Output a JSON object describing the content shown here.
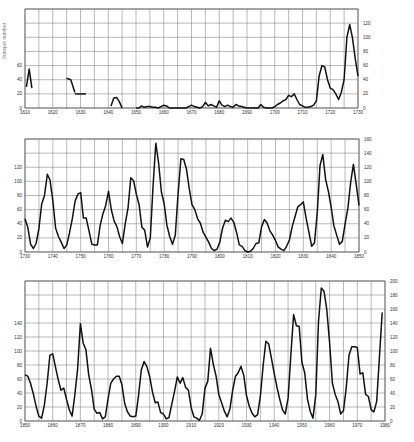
{
  "chart_data": [
    {
      "type": "line",
      "title": "",
      "ylabel": "Sunspot number",
      "xlabel": "",
      "xlim": [
        1610,
        1730
      ],
      "ylim": [
        0,
        140
      ],
      "grid": true,
      "x_ticks": [
        "1610",
        "1620",
        "1630",
        "1640",
        "1650",
        "1660",
        "1670",
        "1680",
        "1690",
        "1700",
        "1710",
        "1720",
        "1730"
      ],
      "y_ticks_left": [
        "0",
        "20",
        "40",
        "60"
      ],
      "y_ticks_right": [
        "0",
        "20",
        "40",
        "60",
        "80",
        "100",
        "120"
      ],
      "frame": {
        "left": 25,
        "top": 9,
        "right": 358,
        "bottom": 108
      },
      "segments": [
        {
          "x": [
            1610.5,
            1611.5,
            1612.5
          ],
          "y": [
            30,
            55,
            28
          ]
        },
        {
          "x": [
            1625,
            1626.5,
            1628
          ],
          "y": [
            42,
            40,
            22
          ]
        },
        {
          "x": [
            1628,
            1632
          ],
          "y": [
            20,
            20
          ]
        },
        {
          "x": [
            1641,
            1642,
            1643,
            1644,
            1645
          ],
          "y": [
            3,
            14,
            15,
            9,
            0
          ]
        },
        {
          "x": [
            1650,
            1651,
            1652,
            1653,
            1654,
            1655,
            1656,
            1657,
            1658,
            1659,
            1660,
            1661,
            1662,
            1663,
            1664,
            1665,
            1666,
            1667,
            1668,
            1669,
            1670,
            1671,
            1672,
            1673,
            1674,
            1675,
            1676,
            1677,
            1678,
            1679,
            1680,
            1681,
            1682,
            1683,
            1684,
            1685,
            1686,
            1687,
            1688,
            1689,
            1690,
            1691,
            1692,
            1693,
            1694,
            1695,
            1696,
            1697,
            1698,
            1699,
            1700,
            1701,
            1702,
            1703,
            1704,
            1705,
            1706,
            1707,
            1708,
            1709,
            1710,
            1711,
            1712,
            1713,
            1714,
            1715,
            1716,
            1717,
            1718,
            1719,
            1720,
            1721,
            1722,
            1723,
            1724,
            1725,
            1726,
            1727,
            1728,
            1729,
            1730
          ],
          "y": [
            0,
            0,
            3,
            1,
            2,
            2,
            1,
            1,
            0,
            2,
            4,
            3,
            0,
            0,
            0,
            0,
            0,
            0,
            0,
            2,
            4,
            2,
            1,
            0,
            2,
            8,
            3,
            5,
            3,
            1,
            10,
            4,
            2,
            4,
            2,
            1,
            5,
            3,
            2,
            1,
            0,
            0,
            0,
            0,
            0,
            5,
            1,
            0,
            0,
            0,
            2,
            5,
            7,
            10,
            12,
            18,
            16,
            20,
            12,
            5,
            3,
            1,
            1,
            2,
            4,
            10,
            45,
            60,
            58,
            40,
            28,
            26,
            20,
            12,
            22,
            40,
            100,
            118,
            100,
            70,
            45
          ]
        }
      ]
    },
    {
      "type": "line",
      "title": "",
      "xlim": [
        1730,
        1850
      ],
      "ylim": [
        0,
        160
      ],
      "grid": true,
      "x_ticks": [
        "1730",
        "1740",
        "1750",
        "1760",
        "1770",
        "1780",
        "1790",
        "1800",
        "1810",
        "1820",
        "1830",
        "1840",
        "1850"
      ],
      "y_ticks_left": [
        "0",
        "20",
        "40",
        "60",
        "80",
        "100",
        "120"
      ],
      "y_ticks_right": [
        "0",
        "20",
        "40",
        "60",
        "80",
        "100",
        "120",
        "140",
        "160"
      ],
      "frame": {
        "left": 25,
        "top": 139,
        "right": 359,
        "bottom": 252
      },
      "segments": [
        {
          "x": [
            1730,
            1731,
            1732,
            1733,
            1734,
            1735,
            1736,
            1737,
            1738,
            1739,
            1740,
            1741,
            1742,
            1743,
            1744,
            1745,
            1746,
            1747,
            1748,
            1749,
            1750,
            1751,
            1752,
            1753,
            1754,
            1755,
            1756,
            1757,
            1758,
            1759,
            1760,
            1761,
            1762,
            1763,
            1764,
            1765,
            1766,
            1767,
            1768,
            1769,
            1770,
            1771,
            1772,
            1773,
            1774,
            1775,
            1776,
            1777,
            1778,
            1779,
            1780,
            1781,
            1782,
            1783,
            1784,
            1785,
            1786,
            1787,
            1788,
            1789,
            1790,
            1791,
            1792,
            1793,
            1794,
            1795,
            1796,
            1797,
            1798,
            1799,
            1800,
            1801,
            1802,
            1803,
            1804,
            1805,
            1806,
            1807,
            1808,
            1809,
            1810,
            1811,
            1812,
            1813,
            1814,
            1815,
            1816,
            1817,
            1818,
            1819,
            1820,
            1821,
            1822,
            1823,
            1824,
            1825,
            1826,
            1827,
            1828,
            1829,
            1830,
            1831,
            1832,
            1833,
            1834,
            1835,
            1836,
            1837,
            1838,
            1839,
            1840,
            1841,
            1842,
            1843,
            1844,
            1845,
            1846,
            1847,
            1848,
            1849,
            1850
          ],
          "y": [
            47,
            35,
            11,
            5,
            12,
            33,
            68,
            80,
            110,
            102,
            73,
            34,
            22,
            14,
            5,
            10,
            27,
            47,
            72,
            82,
            84,
            48,
            48,
            30,
            11,
            10,
            10,
            38,
            54,
            66,
            86,
            60,
            44,
            36,
            22,
            12,
            40,
            62,
            105,
            101,
            82,
            67,
            35,
            31,
            7,
            20,
            92,
            154,
            126,
            85,
            68,
            38,
            22,
            11,
            24,
            83,
            132,
            131,
            118,
            90,
            67,
            60,
            47,
            41,
            28,
            21,
            14,
            5,
            2,
            4,
            14,
            34,
            45,
            43,
            48,
            42,
            28,
            10,
            8,
            2,
            0,
            1,
            5,
            12,
            13,
            36,
            46,
            41,
            30,
            24,
            16,
            7,
            4,
            2,
            8,
            17,
            36,
            50,
            64,
            67,
            71,
            48,
            28,
            8,
            13,
            57,
            122,
            138,
            103,
            86,
            63,
            37,
            24,
            11,
            15,
            40,
            62,
            98,
            124,
            96,
            66
          ]
        }
      ]
    },
    {
      "type": "line",
      "title": "",
      "xlim": [
        1850,
        1980
      ],
      "ylim": [
        0,
        200
      ],
      "grid": true,
      "x_ticks": [
        "1850",
        "1860",
        "1870",
        "1880",
        "1890",
        "1900",
        "1910",
        "1920",
        "1930",
        "1940",
        "1950",
        "1960",
        "1970",
        "1980"
      ],
      "y_ticks_left": [
        "0",
        "20",
        "40",
        "60",
        "80",
        "100",
        "120",
        "140"
      ],
      "y_ticks_right": [
        "0",
        "20",
        "40",
        "60",
        "80",
        "100",
        "120",
        "140",
        "160",
        "180",
        "200"
      ],
      "frame": {
        "left": 25,
        "top": 281,
        "right": 385,
        "bottom": 421
      },
      "segments": [
        {
          "x": [
            1850,
            1851,
            1852,
            1853,
            1854,
            1855,
            1856,
            1857,
            1858,
            1859,
            1860,
            1861,
            1862,
            1863,
            1864,
            1865,
            1866,
            1867,
            1868,
            1869,
            1870,
            1871,
            1872,
            1873,
            1874,
            1875,
            1876,
            1877,
            1878,
            1879,
            1880,
            1881,
            1882,
            1883,
            1884,
            1885,
            1886,
            1887,
            1888,
            1889,
            1890,
            1891,
            1892,
            1893,
            1894,
            1895,
            1896,
            1897,
            1898,
            1899,
            1900,
            1901,
            1902,
            1903,
            1904,
            1905,
            1906,
            1907,
            1908,
            1909,
            1910,
            1911,
            1912,
            1913,
            1914,
            1915,
            1916,
            1917,
            1918,
            1919,
            1920,
            1921,
            1922,
            1923,
            1924,
            1925,
            1926,
            1927,
            1928,
            1929,
            1930,
            1931,
            1932,
            1933,
            1934,
            1935,
            1936,
            1937,
            1938,
            1939,
            1940,
            1941,
            1942,
            1943,
            1944,
            1945,
            1946,
            1947,
            1948,
            1949,
            1950,
            1951,
            1952,
            1953,
            1954,
            1955,
            1956,
            1957,
            1958,
            1959,
            1960,
            1961,
            1962,
            1963,
            1964,
            1965,
            1966,
            1967,
            1968,
            1969,
            1970,
            1971,
            1972,
            1973,
            1974,
            1975,
            1976,
            1977,
            1978,
            1979
          ],
          "y": [
            66,
            64,
            54,
            39,
            21,
            7,
            4,
            23,
            55,
            94,
            96,
            77,
            59,
            44,
            47,
            31,
            16,
            7,
            37,
            74,
            139,
            111,
            102,
            66,
            45,
            17,
            11,
            12,
            3,
            6,
            32,
            54,
            60,
            64,
            64,
            52,
            25,
            13,
            7,
            6,
            7,
            36,
            73,
            85,
            78,
            64,
            42,
            26,
            27,
            12,
            10,
            3,
            5,
            24,
            42,
            63,
            54,
            62,
            48,
            44,
            19,
            6,
            4,
            1,
            10,
            47,
            57,
            104,
            81,
            64,
            38,
            26,
            14,
            6,
            17,
            44,
            64,
            69,
            78,
            65,
            36,
            21,
            11,
            6,
            9,
            36,
            80,
            114,
            110,
            89,
            68,
            48,
            31,
            16,
            10,
            33,
            93,
            152,
            136,
            135,
            84,
            69,
            31,
            14,
            4,
            38,
            142,
            190,
            185,
            159,
            112,
            54,
            38,
            28,
            10,
            15,
            47,
            94,
            106,
            106,
            105,
            67,
            69,
            38,
            35,
            16,
            13,
            28,
            93,
            155
          ]
        }
      ]
    }
  ]
}
